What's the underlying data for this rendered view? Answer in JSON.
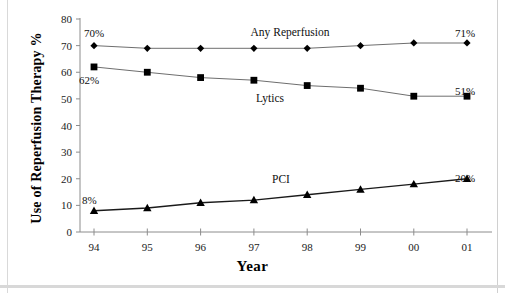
{
  "figure": {
    "background_color": "#ffffff",
    "axis_color": "#8c8c8c",
    "marker_color": "#000000",
    "line_color": "#6e6e6e",
    "pci_line_color": "#1a1a1a"
  },
  "axes": {
    "x_title": "Year",
    "y_title": "Use of Reperfusion Therapy %",
    "y_ticks": [
      "0",
      "10",
      "20",
      "30",
      "40",
      "50",
      "60",
      "70",
      "80"
    ],
    "x_ticks": [
      "94",
      "95",
      "96",
      "97",
      "98",
      "99",
      "00",
      "01"
    ]
  },
  "series_labels": {
    "any_reperfusion": "Any Reperfusion",
    "lytics": "Lytics",
    "pci": "PCI"
  },
  "endpoint_labels": {
    "any_reperfusion_start": "70%",
    "any_reperfusion_end": "71%",
    "lytics_start": "62%",
    "lytics_end": "51%",
    "pci_start": "8%",
    "pci_end": "20%"
  },
  "chart_data": {
    "type": "line",
    "title": "",
    "xlabel": "Year",
    "ylabel": "Use of Reperfusion Therapy %",
    "categories": [
      "94",
      "95",
      "96",
      "97",
      "98",
      "99",
      "00",
      "01"
    ],
    "ylim": [
      0,
      80
    ],
    "ytick_step": 10,
    "grid": false,
    "legend": "inline-labels",
    "series": [
      {
        "name": "Any Reperfusion",
        "marker": "diamond",
        "values": [
          70,
          69,
          69,
          69,
          69,
          70,
          71,
          71
        ]
      },
      {
        "name": "Lytics",
        "marker": "square",
        "values": [
          62,
          60,
          58,
          57,
          55,
          54,
          51,
          51
        ]
      },
      {
        "name": "PCI",
        "marker": "triangle",
        "values": [
          8,
          9,
          11,
          12,
          14,
          16,
          18,
          20
        ]
      }
    ],
    "annotations": [
      {
        "text": "70%",
        "series": "Any Reperfusion",
        "x": "94"
      },
      {
        "text": "71%",
        "series": "Any Reperfusion",
        "x": "01"
      },
      {
        "text": "62%",
        "series": "Lytics",
        "x": "94"
      },
      {
        "text": "51%",
        "series": "Lytics",
        "x": "01"
      },
      {
        "text": "8%",
        "series": "PCI",
        "x": "94"
      },
      {
        "text": "20%",
        "series": "PCI",
        "x": "01"
      }
    ]
  }
}
